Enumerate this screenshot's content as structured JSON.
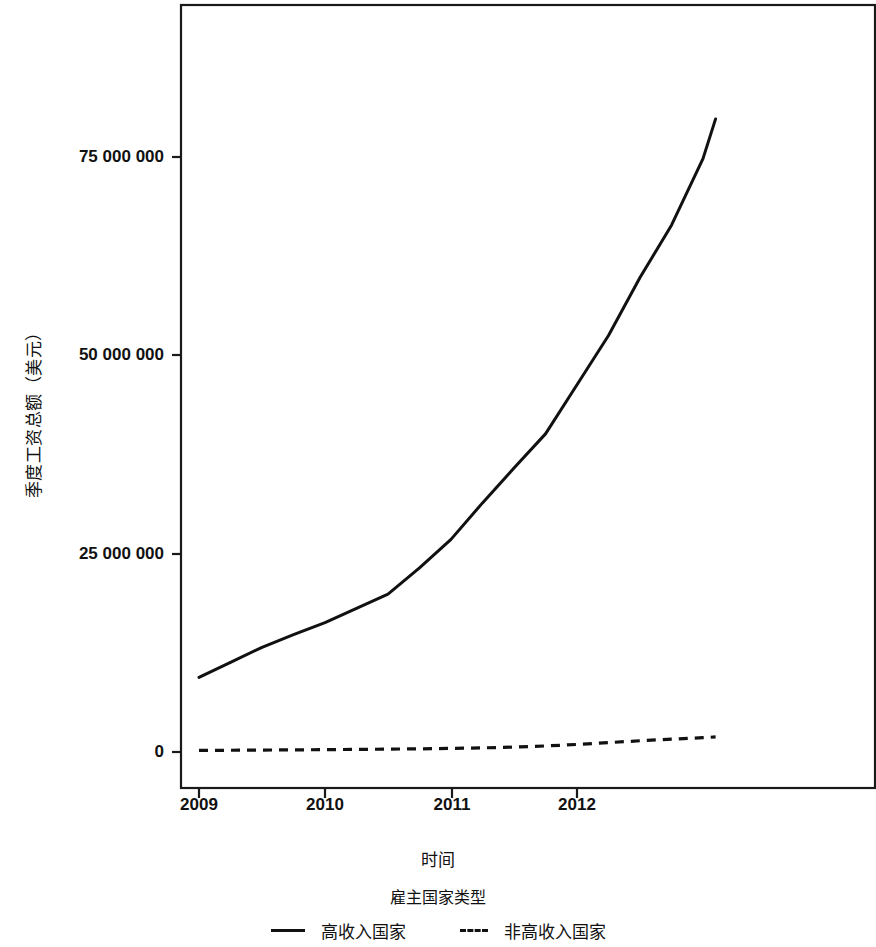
{
  "chart_data": {
    "type": "line",
    "title": "",
    "xlabel": "时间",
    "ylabel": "季度工资总额（美元）",
    "legend_title": "雇主国家类型",
    "legend_position": "bottom",
    "grid": false,
    "xlim": [
      2008.88,
      2013.22
    ],
    "ylim": [
      -3000000,
      94000000
    ],
    "x_tick_labels": [
      "2009",
      "2010",
      "2011",
      "2012"
    ],
    "x_tick_values": [
      2009,
      2010,
      2011,
      2012
    ],
    "y_tick_labels": [
      "0",
      "25 000 000",
      "50 000 000",
      "75 000 000"
    ],
    "y_tick_values": [
      0,
      25000000,
      50000000,
      75000000
    ],
    "x": [
      2009.0,
      2009.25,
      2009.5,
      2009.75,
      2010.0,
      2010.25,
      2010.5,
      2010.75,
      2011.0,
      2011.25,
      2011.5,
      2011.75,
      2012.0,
      2012.25,
      2012.5,
      2012.75,
      2013.0,
      2013.1
    ],
    "series": [
      {
        "name": "高收入国家",
        "style": "solid",
        "color": "#111111",
        "values": [
          9400000,
          11300000,
          13200000,
          14800000,
          16300000,
          18100000,
          19900000,
          23200000,
          26800000,
          31400000,
          35800000,
          40100000,
          46300000,
          52500000,
          59800000,
          66400000,
          74800000,
          79800000
        ]
      },
      {
        "name": "非高收入国家",
        "style": "dashed",
        "color": "#111111",
        "values": [
          200000,
          220000,
          240000,
          270000,
          300000,
          330000,
          360000,
          400000,
          450000,
          520000,
          620000,
          760000,
          950000,
          1180000,
          1420000,
          1620000,
          1800000,
          1900000
        ]
      }
    ],
    "series_extra_tail": {
      "note": "",
      "solid_end_value": 89600000,
      "dashed_end_value": 1900000
    }
  },
  "axes": {
    "y_title": "季度工资总额（美元）",
    "x_title": "时间"
  },
  "legend": {
    "title": "雇主国家类型",
    "entries": [
      {
        "label": "高收入国家",
        "style": "solid"
      },
      {
        "label": "非高收入国家",
        "style": "dashed"
      }
    ]
  },
  "y_ticks": [
    {
      "label": "75 000 000",
      "y": 157
    },
    {
      "label": "50 000 000",
      "y": 355
    },
    {
      "label": "25 000 000",
      "y": 554
    },
    {
      "label": "0",
      "y": 752
    }
  ],
  "x_ticks": [
    {
      "label": "2009",
      "x": 199
    },
    {
      "label": "2010",
      "x": 325
    },
    {
      "label": "2011",
      "x": 452
    },
    {
      "label": "2012",
      "x": 577
    }
  ]
}
